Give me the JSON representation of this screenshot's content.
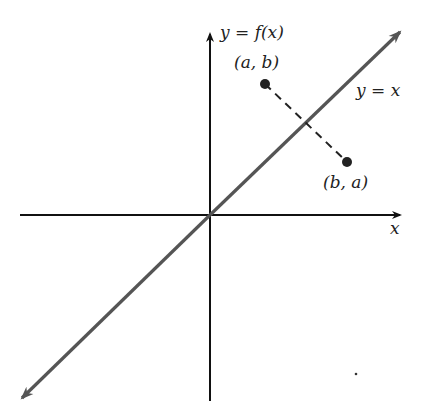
{
  "diagram": {
    "axes": {
      "y_label": "y = f(x)",
      "x_label": "x"
    },
    "line_label": "y = x",
    "points": [
      {
        "label": "(a, b)",
        "x": 265,
        "y": 84
      },
      {
        "label": "(b, a)",
        "x": 347,
        "y": 162
      }
    ],
    "colors": {
      "axis": "#111111",
      "line": "#555555",
      "dash": "#222222",
      "point": "#222222"
    }
  }
}
